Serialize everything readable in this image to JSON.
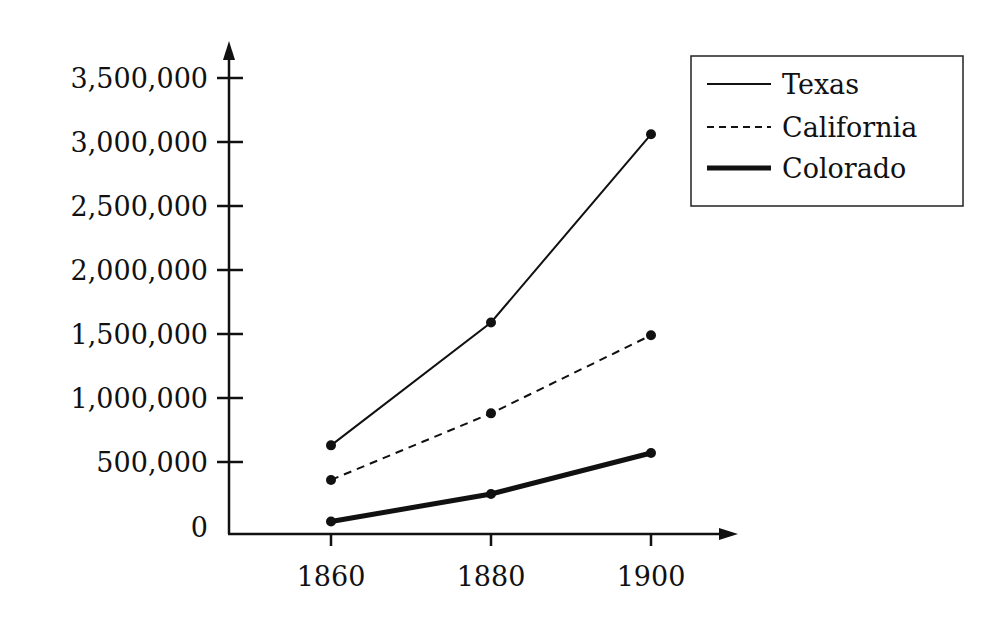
{
  "chart_data": {
    "type": "line",
    "title": "",
    "xlabel": "",
    "ylabel": "",
    "x": [
      "1860",
      "1880",
      "1900"
    ],
    "y_ticks": [
      "0",
      "500,000",
      "1,000,000",
      "1,500,000",
      "2,000,000",
      "2,500,000",
      "3,000,000",
      "3,500,000"
    ],
    "ylim": [
      0,
      3500000
    ],
    "grid": false,
    "legend_position": "upper right",
    "series": [
      {
        "name": "Texas",
        "style": "solid",
        "values": [
          630000,
          1590000,
          3060000
        ]
      },
      {
        "name": "California",
        "style": "dashed",
        "values": [
          360000,
          880000,
          1490000
        ]
      },
      {
        "name": "Colorado",
        "style": "thick",
        "values": [
          35000,
          250000,
          570000
        ]
      }
    ]
  },
  "legend": {
    "items": [
      {
        "label": "Texas"
      },
      {
        "label": "California"
      },
      {
        "label": "Colorado"
      }
    ]
  }
}
